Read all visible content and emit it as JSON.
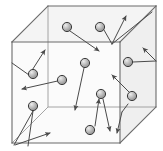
{
  "figure": {
    "type": "diagram",
    "width": 163,
    "height": 151,
    "background_color": "#ffffff"
  },
  "colors": {
    "edge_stroke": "#6b6b6b",
    "face_light": "#fbfbfb",
    "face_mid": "#f4f4f4",
    "face_shade": "#efefef",
    "particle_fill": "#b8b8b8",
    "particle_edge": "#3b3b3b",
    "particle_highlight": "#e8e8e8",
    "arrow_stroke": "#4a4a4a"
  },
  "cube": {
    "name": "container-cube",
    "front_face": {
      "name": "cube-front-face",
      "points": "12,42 120,42 120,143 12,143"
    },
    "top_face": {
      "name": "cube-top-face",
      "points": "12,42 48,6 156,6 120,42"
    },
    "right_face": {
      "name": "cube-right-face",
      "points": "120,42 156,6 156,107 120,143"
    },
    "hidden_edges": [
      {
        "name": "cube-hidden-edge-vertical",
        "x1": 48,
        "y1": 6,
        "x2": 48,
        "y2": 107
      },
      {
        "name": "cube-hidden-edge-bottom-left",
        "x1": 12,
        "y1": 143,
        "x2": 48,
        "y2": 107
      },
      {
        "name": "cube-hidden-edge-bottom-right",
        "x1": 48,
        "y1": 107,
        "x2": 156,
        "y2": 107
      }
    ],
    "visible_edges": [
      {
        "name": "cube-edge-front-top",
        "x1": 12,
        "y1": 42,
        "x2": 120,
        "y2": 42
      },
      {
        "name": "cube-edge-front-left",
        "x1": 12,
        "y1": 42,
        "x2": 12,
        "y2": 143
      },
      {
        "name": "cube-edge-front-right",
        "x1": 120,
        "y1": 42,
        "x2": 120,
        "y2": 143
      },
      {
        "name": "cube-edge-front-bottom",
        "x1": 12,
        "y1": 143,
        "x2": 120,
        "y2": 143
      },
      {
        "name": "cube-edge-top-left-diagonal",
        "x1": 12,
        "y1": 42,
        "x2": 48,
        "y2": 6
      },
      {
        "name": "cube-edge-top-right-diagonal",
        "x1": 120,
        "y1": 42,
        "x2": 156,
        "y2": 6
      },
      {
        "name": "cube-edge-back-top",
        "x1": 48,
        "y1": 6,
        "x2": 156,
        "y2": 6
      },
      {
        "name": "cube-edge-back-right-vertical",
        "x1": 156,
        "y1": 6,
        "x2": 156,
        "y2": 107
      },
      {
        "name": "cube-edge-bottom-right-diagonal",
        "x1": 120,
        "y1": 143,
        "x2": 156,
        "y2": 107
      }
    ]
  },
  "particles": [
    {
      "name": "particle-top-left-inner",
      "cx": 67,
      "cy": 27,
      "r": 5
    },
    {
      "name": "particle-top-right-inner",
      "cx": 100,
      "cy": 27,
      "r": 5
    },
    {
      "name": "particle-left-upper",
      "cx": 33,
      "cy": 74,
      "r": 5
    },
    {
      "name": "particle-left-lower",
      "cx": 33,
      "cy": 106,
      "r": 5
    },
    {
      "name": "particle-center-upper",
      "cx": 85,
      "cy": 63,
      "r": 5
    },
    {
      "name": "particle-mid-left",
      "cx": 62,
      "cy": 80,
      "r": 5
    },
    {
      "name": "particle-center-lower",
      "cx": 101,
      "cy": 94,
      "r": 5
    },
    {
      "name": "particle-bottom-center",
      "cx": 90,
      "cy": 130,
      "r": 5
    },
    {
      "name": "particle-right-upper",
      "cx": 128,
      "cy": 62,
      "r": 5
    },
    {
      "name": "particle-right-lower",
      "cx": 132,
      "cy": 96,
      "r": 5
    }
  ],
  "velocity_arrows": [
    {
      "name": "arrow-from-top-left-particle",
      "x1": 70,
      "y1": 31,
      "x2": 99,
      "y2": 51,
      "head": true
    },
    {
      "name": "arrow-top-right-up",
      "x1": 112,
      "y1": 44,
      "x2": 126,
      "y2": 16,
      "head": true
    },
    {
      "name": "arrow-top-right-to-particle",
      "x1": 112,
      "y1": 44,
      "x2": 104,
      "y2": 30,
      "head": false
    },
    {
      "name": "arrow-top-right-diagonal-edge",
      "x1": 112,
      "y1": 44,
      "x2": 152,
      "y2": 12,
      "head": false
    },
    {
      "name": "arrow-left-upper-up-right",
      "x1": 29,
      "y1": 75,
      "x2": 45,
      "y2": 50,
      "head": true
    },
    {
      "name": "arrow-left-upper-to-corner",
      "x1": 29,
      "y1": 75,
      "x2": 12,
      "y2": 63,
      "head": false
    },
    {
      "name": "arrow-left-mid-pointing-left",
      "x1": 62,
      "y1": 80,
      "x2": 22,
      "y2": 89,
      "head": true
    },
    {
      "name": "arrow-left-lower-down-left",
      "x1": 33,
      "y1": 111,
      "x2": 14,
      "y2": 145,
      "head": false
    },
    {
      "name": "arrow-left-lower-down",
      "x1": 33,
      "y1": 111,
      "x2": 28,
      "y2": 146,
      "head": false
    },
    {
      "name": "arrow-bottom-left-up-right",
      "x1": 15,
      "y1": 145,
      "x2": 50,
      "y2": 133,
      "head": true
    },
    {
      "name": "arrow-center-upper-down-left",
      "x1": 84,
      "y1": 68,
      "x2": 75,
      "y2": 110,
      "head": true
    },
    {
      "name": "arrow-center-lower-up",
      "x1": 95,
      "y1": 126,
      "x2": 99,
      "y2": 99,
      "head": true
    },
    {
      "name": "arrow-center-lower-down-right",
      "x1": 103,
      "y1": 99,
      "x2": 110,
      "y2": 131,
      "head": true
    },
    {
      "name": "arrow-right-upper-horizontal",
      "x1": 133,
      "y1": 62,
      "x2": 156,
      "y2": 61,
      "head": false
    },
    {
      "name": "arrow-right-upper-up-right",
      "x1": 156,
      "y1": 61,
      "x2": 143,
      "y2": 48,
      "head": true
    },
    {
      "name": "arrow-right-lower-up-left",
      "x1": 129,
      "y1": 92,
      "x2": 112,
      "y2": 75,
      "head": true
    },
    {
      "name": "arrow-right-edge-down",
      "x1": 122,
      "y1": 112,
      "x2": 117,
      "y2": 133,
      "head": true
    },
    {
      "name": "arrow-right-edge-down-source",
      "x1": 128,
      "y1": 104,
      "x2": 122,
      "y2": 112,
      "head": false
    }
  ]
}
